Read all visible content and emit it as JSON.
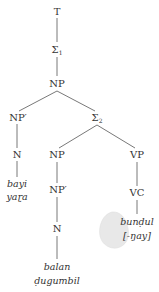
{
  "diagram": {
    "type": "syntax-tree",
    "colors": {
      "line": "#555555",
      "text": "#333333",
      "blob": "#e6e6e6"
    },
    "nodes": {
      "t": {
        "label": "T"
      },
      "sigma1": {
        "label": "Σ",
        "sub": "1"
      },
      "np_root": {
        "label": "NP"
      },
      "np_prime_left": {
        "label": "NP′"
      },
      "sigma2": {
        "label": "Σ",
        "sub": "2"
      },
      "n_left": {
        "label": "N"
      },
      "np_mid": {
        "label": "NP"
      },
      "vp": {
        "label": "VP"
      },
      "np_prime_mid": {
        "label": "NP′"
      },
      "vc": {
        "label": "VC"
      },
      "n_mid": {
        "label": "N"
      }
    },
    "leaves": {
      "left_line1": "bayi",
      "left_line2": "yaɽa",
      "mid_line1": "balan",
      "mid_line2": "ḍugumbil",
      "right_line1": "bunḍul",
      "right_line2": "[-ŋay]"
    }
  }
}
